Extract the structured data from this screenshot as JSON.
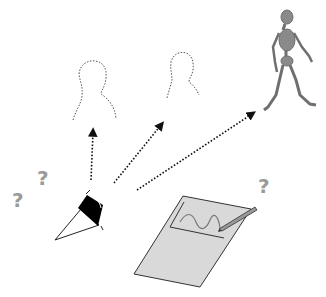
{
  "diagram": {
    "colors": {
      "background": "#ffffff",
      "outline": "#333333",
      "question_mark": "#9a9a9a",
      "paper_fill": "#d9d9d9",
      "skeleton": "#8a8a8a",
      "sensor_band": "#000000"
    },
    "question_marks": [
      {
        "id": "q1",
        "text": "?",
        "x": 12,
        "y": 190,
        "size": 20
      },
      {
        "id": "q2",
        "text": "?",
        "x": 37,
        "y": 168,
        "size": 20
      },
      {
        "id": "q3",
        "text": "?",
        "x": 258,
        "y": 176,
        "size": 20
      }
    ],
    "nodes": [
      {
        "id": "sensor",
        "label": "wearable-sensor"
      },
      {
        "id": "person1",
        "label": "dashed-person-silhouette"
      },
      {
        "id": "person2",
        "label": "dashed-person-silhouette"
      },
      {
        "id": "walker",
        "label": "walking-skeleton"
      },
      {
        "id": "paper",
        "label": "paper-with-signal-and-pen"
      }
    ],
    "edges": [
      {
        "from": "sensor",
        "to": "person1",
        "style": "dotted-arrow"
      },
      {
        "from": "sensor",
        "to": "person2",
        "style": "dotted-arrow"
      },
      {
        "from": "sensor",
        "to": "walker",
        "style": "dotted-arrow"
      }
    ]
  }
}
